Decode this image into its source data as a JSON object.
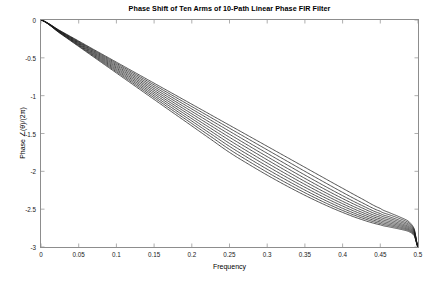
{
  "chart_data": {
    "type": "line",
    "title": "Phase Shift of Ten Arms of 10-Path Linear Phase FIR Filter",
    "xlabel": "Frequency",
    "ylabel": "Phase ∠(θ)/(2π)",
    "xlim": [
      0,
      0.5
    ],
    "ylim": [
      -3,
      0
    ],
    "grid": false,
    "legend": null,
    "legend_position": "none",
    "line_color": "#1a1a1a",
    "background_color": "#ffffff",
    "axis_color": "#8d8d8d",
    "xticks": [
      0,
      0.05,
      0.1,
      0.15,
      0.2,
      0.25,
      0.3,
      0.35,
      0.4,
      0.45,
      0.5
    ],
    "xtick_labels": [
      "0",
      "0.05",
      "0.1",
      "0.15",
      "0.2",
      "0.25",
      "0.3",
      "0.35",
      "0.4",
      "0.45",
      "0.5"
    ],
    "yticks": [
      0,
      -0.5,
      -1,
      -1.5,
      -2,
      -2.5,
      -3
    ],
    "ytick_labels": [
      "0",
      "-0.5",
      "-1",
      "-1.5",
      "-2",
      "-2.5",
      "-3"
    ],
    "n_series": 10,
    "x": [
      0,
      0.025,
      0.05,
      0.075,
      0.1,
      0.125,
      0.15,
      0.175,
      0.2,
      0.225,
      0.25,
      0.275,
      0.3,
      0.325,
      0.35,
      0.375,
      0.4,
      0.425,
      0.45,
      0.4625,
      0.475,
      0.4875,
      0.495,
      0.5
    ],
    "series": [
      {
        "name": "Arm 0",
        "values": [
          0,
          -0.139,
          -0.278,
          -0.418,
          -0.557,
          -0.696,
          -0.835,
          -0.974,
          -1.113,
          -1.252,
          -1.391,
          -1.53,
          -1.669,
          -1.808,
          -1.947,
          -2.086,
          -2.224,
          -2.36,
          -2.49,
          -2.548,
          -2.6,
          -2.66,
          -2.76,
          -3
        ]
      },
      {
        "name": "Arm 1",
        "values": [
          0,
          -0.143,
          -0.286,
          -0.429,
          -0.572,
          -0.715,
          -0.858,
          -1.001,
          -1.144,
          -1.287,
          -1.43,
          -1.573,
          -1.716,
          -1.858,
          -2.0,
          -2.14,
          -2.278,
          -2.41,
          -2.528,
          -2.576,
          -2.622,
          -2.678,
          -2.772,
          -3
        ]
      },
      {
        "name": "Arm 2",
        "values": [
          0,
          -0.147,
          -0.294,
          -0.441,
          -0.588,
          -0.735,
          -0.882,
          -1.029,
          -1.176,
          -1.323,
          -1.47,
          -1.617,
          -1.762,
          -1.906,
          -2.049,
          -2.188,
          -2.322,
          -2.448,
          -2.558,
          -2.602,
          -2.645,
          -2.696,
          -2.784,
          -3
        ]
      },
      {
        "name": "Arm 3",
        "values": [
          0,
          -0.151,
          -0.302,
          -0.453,
          -0.604,
          -0.755,
          -0.906,
          -1.057,
          -1.208,
          -1.359,
          -1.51,
          -1.659,
          -1.806,
          -1.951,
          -2.093,
          -2.23,
          -2.36,
          -2.48,
          -2.583,
          -2.624,
          -2.664,
          -2.712,
          -2.794,
          -3
        ]
      },
      {
        "name": "Arm 4",
        "values": [
          0,
          -0.155,
          -0.31,
          -0.465,
          -0.62,
          -0.775,
          -0.93,
          -1.085,
          -1.24,
          -1.395,
          -1.55,
          -1.7,
          -1.848,
          -1.993,
          -2.134,
          -2.269,
          -2.396,
          -2.511,
          -2.607,
          -2.645,
          -2.683,
          -2.728,
          -2.804,
          -3
        ]
      },
      {
        "name": "Arm 5",
        "values": [
          0,
          -0.159,
          -0.318,
          -0.477,
          -0.636,
          -0.795,
          -0.954,
          -1.113,
          -1.272,
          -1.431,
          -1.59,
          -1.742,
          -1.89,
          -2.034,
          -2.173,
          -2.305,
          -2.428,
          -2.539,
          -2.629,
          -2.665,
          -2.7,
          -2.742,
          -2.814,
          -3
        ]
      },
      {
        "name": "Arm 6",
        "values": [
          0,
          -0.163,
          -0.326,
          -0.489,
          -0.652,
          -0.815,
          -0.978,
          -1.141,
          -1.304,
          -1.467,
          -1.63,
          -1.783,
          -1.931,
          -2.074,
          -2.211,
          -2.34,
          -2.459,
          -2.565,
          -2.65,
          -2.684,
          -2.716,
          -2.756,
          -2.824,
          -3
        ]
      },
      {
        "name": "Arm 7",
        "values": [
          0,
          -0.167,
          -0.334,
          -0.501,
          -0.668,
          -0.835,
          -1.002,
          -1.169,
          -1.336,
          -1.503,
          -1.67,
          -1.824,
          -1.972,
          -2.113,
          -2.248,
          -2.374,
          -2.489,
          -2.59,
          -2.67,
          -2.702,
          -2.732,
          -2.769,
          -2.833,
          -3
        ]
      },
      {
        "name": "Arm 8",
        "values": [
          0,
          -0.171,
          -0.342,
          -0.513,
          -0.684,
          -0.855,
          -1.026,
          -1.197,
          -1.368,
          -1.539,
          -1.71,
          -1.864,
          -2.012,
          -2.151,
          -2.283,
          -2.406,
          -2.517,
          -2.613,
          -2.689,
          -2.719,
          -2.747,
          -2.781,
          -2.842,
          -3
        ]
      },
      {
        "name": "Arm 9",
        "values": [
          0,
          -0.175,
          -0.35,
          -0.525,
          -0.7,
          -0.875,
          -1.05,
          -1.225,
          -1.4,
          -1.575,
          -1.75,
          -1.904,
          -2.05,
          -2.188,
          -2.317,
          -2.436,
          -2.543,
          -2.636,
          -2.707,
          -2.736,
          -2.762,
          -2.794,
          -2.851,
          -3
        ]
      }
    ]
  }
}
